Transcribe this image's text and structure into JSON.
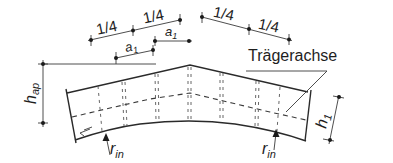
{
  "diagram": {
    "labels": {
      "quarter_left_1": "1/4",
      "quarter_left_2": "1/4",
      "quarter_right_1": "1/4",
      "quarter_right_2": "1/4",
      "a1_left": "a",
      "a1_left_sub": "1",
      "a1_right": "a",
      "a1_right_sub": "1",
      "h_ap": "h",
      "h_ap_sub": "ap",
      "h_1": "h",
      "h_1_sub": "1",
      "r_in_left": "r",
      "r_in_left_sub": "in",
      "r_in_right": "r",
      "r_in_right_sub": "in",
      "beam_axis": "Trägerachse"
    },
    "colors": {
      "line": "#2a2a2a",
      "background": "#ffffff"
    }
  }
}
